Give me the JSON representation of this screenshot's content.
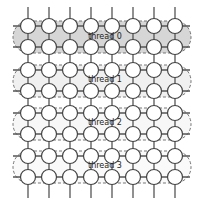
{
  "diagram": {
    "type": "grid-thread-partition",
    "grid": {
      "columns": 8,
      "rows": 8
    },
    "column_x": [
      28,
      49,
      70,
      91,
      112,
      133,
      154,
      175
    ],
    "row_y": [
      26,
      47,
      70,
      91,
      113,
      134,
      156,
      177
    ],
    "node_radius": 7.5,
    "threads": [
      {
        "label": "thread 0",
        "rows": [
          0,
          1
        ],
        "fill": "#d6d6d6",
        "closed_left": true
      },
      {
        "label": "thread 1",
        "rows": [
          2,
          3
        ],
        "fill": "#f0f0f0",
        "closed_left": false
      },
      {
        "label": "thread 2",
        "rows": [
          4,
          5
        ],
        "fill": "#f7f7f7",
        "closed_left": false
      },
      {
        "label": "thread 3",
        "rows": [
          6,
          7
        ],
        "fill": "#fafafa",
        "closed_left": false
      }
    ],
    "colors": {
      "edge": "#555555",
      "node_stroke": "#444444",
      "node_fill": "#ffffff",
      "region_stroke": "#666666"
    }
  }
}
